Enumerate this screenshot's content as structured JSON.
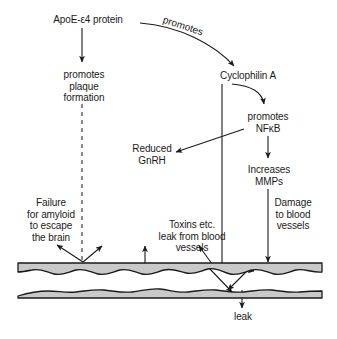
{
  "figure": {
    "background_color": "#ffffff",
    "stroke_color": "#1a1a1a",
    "vessel_fill_color": "#c8c8c8",
    "width": 337,
    "height": 339
  },
  "nodes": {
    "apoe": "ApoE-ε4 protein",
    "plaque": "promotes\nplaque\nformation",
    "cyclophilin": "Cyclophilin A",
    "nfkb": "promotes\nNFκB",
    "gnrh": "Reduced\nGnRH",
    "mmps": "Increases\nMMPs",
    "failure": "Failure\nfor amyloid\nto escape\nthe brain",
    "damage": "Damage\nto blood\nvessels",
    "toxins": "Toxins etc.\nleak from blood\nvessels",
    "leak": "leak"
  },
  "edges": {
    "promotes_curve": "promotes"
  }
}
